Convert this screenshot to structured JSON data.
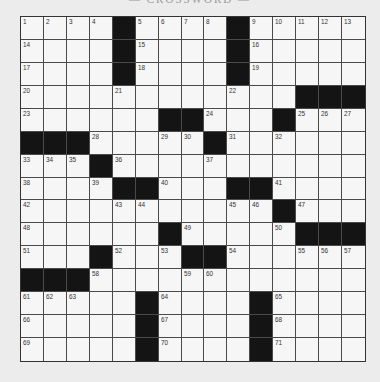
{
  "puzzle": {
    "title": "— CROSSWORD —",
    "size": {
      "rows": 15,
      "cols": 15
    },
    "colors": {
      "black": "#141414",
      "cell": "#f6f6f6",
      "line": "#4a4a4a",
      "background": "#ececec"
    },
    "grid": [
      [
        "1",
        "2",
        "3",
        "4",
        "#",
        "5",
        "6",
        "7",
        "8",
        "#",
        "9",
        "10",
        "11",
        "12",
        "13"
      ],
      [
        "14",
        "",
        "",
        "",
        "#",
        "15",
        "",
        "",
        "",
        "#",
        "16",
        "",
        "",
        "",
        ""
      ],
      [
        "17",
        "",
        "",
        "",
        "#",
        "18",
        "",
        "",
        "",
        "#",
        "19",
        "",
        "",
        "",
        ""
      ],
      [
        "20",
        "",
        "",
        "",
        "21",
        "",
        "",
        "",
        "",
        "22",
        "",
        "",
        "#",
        "#",
        "#"
      ],
      [
        "23",
        "",
        "",
        "",
        "",
        "",
        "#",
        "#",
        "24",
        "",
        "",
        "#",
        "25",
        "26",
        "27"
      ],
      [
        "#",
        "#",
        "#",
        "28",
        "",
        "",
        "29",
        "30",
        "#",
        "31",
        "",
        "32",
        "",
        "",
        ""
      ],
      [
        "33",
        "34",
        "35",
        "#",
        "36",
        "",
        "",
        "",
        "37",
        "",
        "",
        "",
        "",
        "",
        ""
      ],
      [
        "38",
        "",
        "",
        "39",
        "#",
        "#",
        "40",
        "",
        "",
        "#",
        "#",
        "41",
        "",
        "",
        ""
      ],
      [
        "42",
        "",
        "",
        "",
        "43",
        "44",
        "",
        "",
        "",
        "45",
        "46",
        "#",
        "47",
        "",
        ""
      ],
      [
        "48",
        "",
        "",
        "",
        "",
        "",
        "#",
        "49",
        "",
        "",
        "",
        "50",
        "#",
        "#",
        "#"
      ],
      [
        "51",
        "",
        "",
        "#",
        "52",
        "",
        "53",
        "#",
        "#",
        "54",
        "",
        "",
        "55",
        "56",
        "57"
      ],
      [
        "#",
        "#",
        "#",
        "58",
        "",
        "",
        "",
        "59",
        "60",
        "",
        "",
        "",
        "",
        "",
        ""
      ],
      [
        "61",
        "62",
        "63",
        "",
        "",
        "#",
        "64",
        "",
        "",
        "",
        "#",
        "65",
        "",
        "",
        ""
      ],
      [
        "66",
        "",
        "",
        "",
        "",
        "#",
        "67",
        "",
        "",
        "",
        "#",
        "68",
        "",
        "",
        ""
      ],
      [
        "69",
        "",
        "",
        "",
        "",
        "#",
        "70",
        "",
        "",
        "",
        "#",
        "71",
        "",
        "",
        ""
      ]
    ]
  }
}
